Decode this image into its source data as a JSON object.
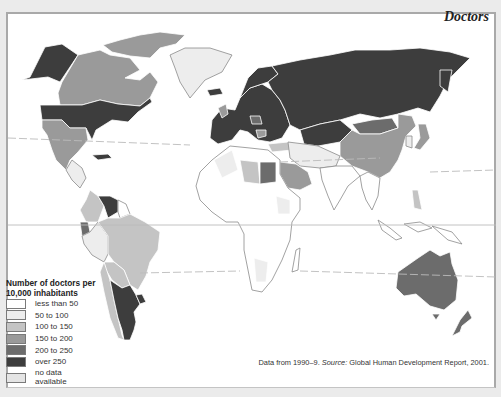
{
  "title": "Doctors",
  "legend": {
    "title_line1": "Number of doctors per",
    "title_line2": "10,000 inhabitants",
    "items": [
      {
        "label": "less than 50",
        "color": "#ffffff"
      },
      {
        "label": "50 to 100",
        "color": "#ededed"
      },
      {
        "label": "100 to 150",
        "color": "#c4c4c4"
      },
      {
        "label": "150 to 200",
        "color": "#9a9a9a"
      },
      {
        "label": "200 to 250",
        "color": "#6c6c6c"
      },
      {
        "label": "over 250",
        "color": "#3d3d3d"
      },
      {
        "label": "no data available",
        "label_line1": "no data",
        "label_line2": "available",
        "color": "#e4e4e4"
      }
    ]
  },
  "footnote": {
    "prefix": "Data from 1990–9.",
    "source_label": "Source:",
    "source": "Global Human Development Report, 2001."
  },
  "map": {
    "lines": [
      "Tropic of Cancer (dashed)",
      "Equator (solid)",
      "Tropic of Capricorn (dashed)"
    ],
    "regions": [
      {
        "name": "Alaska / USA",
        "category": "over 250"
      },
      {
        "name": "Canada",
        "category": "150 to 200"
      },
      {
        "name": "Greenland",
        "category": "50 to 100"
      },
      {
        "name": "Mexico",
        "category": "150 to 200"
      },
      {
        "name": "Central America",
        "category": "50 to 100"
      },
      {
        "name": "Cuba",
        "category": "over 250"
      },
      {
        "name": "Venezuela / Guyana",
        "category": "over 250"
      },
      {
        "name": "Colombia",
        "category": "100 to 150"
      },
      {
        "name": "Brazil",
        "category": "100 to 150"
      },
      {
        "name": "Peru",
        "category": "50 to 100"
      },
      {
        "name": "Argentina",
        "category": "over 250"
      },
      {
        "name": "Uruguay",
        "category": "over 250"
      },
      {
        "name": "Chile",
        "category": "100 to 150"
      },
      {
        "name": "Europe",
        "category": "over 250"
      },
      {
        "name": "Russia",
        "category": "over 250"
      },
      {
        "name": "Central Asia",
        "category": "over 250"
      },
      {
        "name": "Mongolia",
        "category": "200 to 250"
      },
      {
        "name": "China",
        "category": "150 to 200"
      },
      {
        "name": "Japan",
        "category": "150 to 200"
      },
      {
        "name": "Libya",
        "category": "100 to 150"
      },
      {
        "name": "Egypt",
        "category": "200 to 250"
      },
      {
        "name": "Saudi Arabia",
        "category": "150 to 200"
      },
      {
        "name": "Iran / Middle East",
        "category": "50 to 100"
      },
      {
        "name": "Africa (most)",
        "category": "less than 50"
      },
      {
        "name": "India",
        "category": "less than 50"
      },
      {
        "name": "Southeast Asia",
        "category": "less than 50"
      },
      {
        "name": "Philippines",
        "category": "100 to 150"
      },
      {
        "name": "Australia",
        "category": "200 to 250"
      },
      {
        "name": "New Zealand",
        "category": "200 to 250"
      }
    ]
  }
}
